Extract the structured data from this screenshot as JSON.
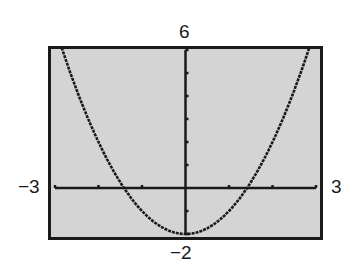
{
  "window": {
    "ymax_label": "6",
    "ymin_label": "−2",
    "xmin_label": "−3",
    "xmax_label": "3"
  },
  "colors": {
    "screen_bg": "#d4d4d4",
    "frame": "#1a1a1a",
    "curve": "#1a1a1a"
  },
  "chart_data": {
    "type": "line",
    "title": "",
    "xlabel": "",
    "ylabel": "",
    "xlim": [
      -3,
      3
    ],
    "ylim": [
      -2,
      6
    ],
    "xscale": 1,
    "yscale": 1,
    "grid": false,
    "series": [
      {
        "name": "parabola",
        "function": "y = x^2 - 2",
        "x": [
          -3,
          -2.5,
          -2,
          -1.5,
          -1,
          -0.5,
          0,
          0.5,
          1,
          1.5,
          2,
          2.5,
          3
        ],
        "values": [
          7,
          4.25,
          2,
          0.25,
          -1,
          -1.75,
          -2,
          -1.75,
          -1,
          0.25,
          2,
          4.25,
          7
        ]
      }
    ],
    "axis_labels": {
      "top": "6",
      "bottom": "−2",
      "left": "−3",
      "right": "3"
    }
  }
}
